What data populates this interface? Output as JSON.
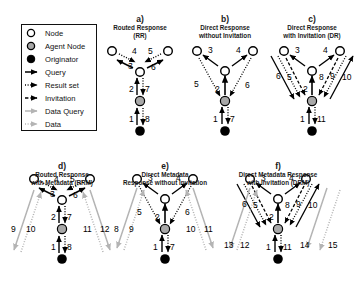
{
  "figure": {
    "background": "#ffffff",
    "node_colors": {
      "node": "#ffffff",
      "agent": "#a8a8a8",
      "originator": "#000000",
      "stroke": "#000000",
      "data_gray": "#b4b4b4"
    }
  },
  "legend": {
    "items": [
      {
        "name": "node",
        "label": "Node",
        "symbol": "open-circle"
      },
      {
        "name": "agent-node",
        "label": "Agent Node",
        "symbol": "gray-circle"
      },
      {
        "name": "originator",
        "label": "Originator",
        "symbol": "filled-circle"
      },
      {
        "name": "query",
        "label": "Query",
        "symbol": "solid-arrow"
      },
      {
        "name": "result-set",
        "label": "Result set",
        "symbol": "dotted-arrow"
      },
      {
        "name": "invitation",
        "label": "Invitation",
        "symbol": "dashed-arrow"
      },
      {
        "name": "data-query",
        "label": "Data Query",
        "symbol": "gray-solid-arrow"
      },
      {
        "name": "data",
        "label": "Data",
        "symbol": "gray-dotted-arrow"
      }
    ]
  },
  "panels": [
    {
      "id": "a",
      "letter": "a)",
      "title": "Routed Response\n(RR)",
      "edge_labels": [
        "1",
        "2",
        "3",
        "4",
        "5",
        "6",
        "7",
        "8"
      ]
    },
    {
      "id": "b",
      "letter": "b)",
      "title": "Direct Response\nwithout Invitation",
      "edge_labels": [
        "1",
        "2",
        "3",
        "4",
        "5",
        "6",
        "7"
      ]
    },
    {
      "id": "c",
      "letter": "c)",
      "title": "Direct Response\nwith Invitation (DR)",
      "edge_labels": [
        "1",
        "2",
        "3",
        "4",
        "5",
        "6",
        "7",
        "8",
        "9",
        "10",
        "11"
      ]
    },
    {
      "id": "d",
      "letter": "d)",
      "title": "Routed Response\nwith Metadata (RRM)",
      "edge_labels": [
        "1",
        "2",
        "3",
        "4",
        "5",
        "6",
        "7",
        "8",
        "9",
        "10",
        "11",
        "12"
      ]
    },
    {
      "id": "e",
      "letter": "e)",
      "title": "Direct Metadata\nResponse without Invitation",
      "edge_labels": [
        "1",
        "2",
        "3",
        "4",
        "5",
        "6",
        "7",
        "8",
        "9",
        "10",
        "11"
      ]
    },
    {
      "id": "f",
      "letter": "f)",
      "title": "Direct Metadata Response\nwith Invitation (DRM)",
      "edge_labels": [
        "1",
        "2",
        "3",
        "4",
        "5",
        "6",
        "7",
        "8",
        "9",
        "10",
        "11",
        "12",
        "13",
        "14",
        "15"
      ]
    }
  ]
}
